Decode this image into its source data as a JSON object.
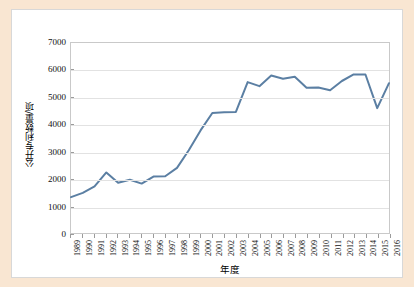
{
  "figure": {
    "background_color": "#f9e6d2",
    "panel_color": "#ffffff",
    "border_color": "#d8d8d8"
  },
  "chart_data": {
    "type": "line",
    "title": "",
    "xlabel": "年度",
    "ylabel": "公开专利数量/项",
    "xlim": [
      1989,
      2016
    ],
    "ylim": [
      0,
      7000
    ],
    "grid": true,
    "legend": null,
    "line_color": "#5b7fa3",
    "line_width": 2,
    "yticks": [
      0,
      1000,
      2000,
      3000,
      4000,
      5000,
      6000,
      7000
    ],
    "ytick_labels": [
      "0",
      "1000",
      "2000",
      "3000",
      "4000",
      "5000",
      "6000",
      "7000"
    ],
    "categories": [
      "1989",
      "1990",
      "1991",
      "1992",
      "1993",
      "1994",
      "1995",
      "1996",
      "1997",
      "1998",
      "1999",
      "2000",
      "2001",
      "2002",
      "2003",
      "2004",
      "2005",
      "2006",
      "2007",
      "2008",
      "2009",
      "2010",
      "2011",
      "2012",
      "2013",
      "2014",
      "2015",
      "2016"
    ],
    "values": [
      1320,
      1480,
      1720,
      2230,
      1850,
      1960,
      1820,
      2080,
      2090,
      2400,
      3050,
      3780,
      4420,
      4450,
      4460,
      5560,
      5410,
      5800,
      5680,
      5760,
      5350,
      5360,
      5260,
      5600,
      5840,
      5840,
      4600,
      5520
    ]
  }
}
